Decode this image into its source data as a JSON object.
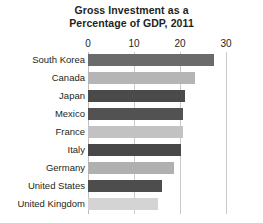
{
  "chart_data": {
    "type": "bar",
    "orientation": "horizontal",
    "title": "Gross Investment as a Percentage of GDP, 2011",
    "title_lines": [
      "Gross Investment as a",
      "Percentage of GDP, 2011"
    ],
    "xlabel": "",
    "ylabel": "",
    "xlim": [
      0,
      30
    ],
    "xticks": [
      0,
      10,
      20,
      30
    ],
    "xtick_labels": [
      "0",
      "10",
      "20",
      "30"
    ],
    "grid": true,
    "grid_axis": "x",
    "legend": false,
    "categories": [
      "South Korea",
      "Canada",
      "Japan",
      "Mexico",
      "France",
      "Italy",
      "Germany",
      "United States",
      "United Kingdom"
    ],
    "values": [
      27.4,
      23.3,
      21.1,
      20.7,
      20.6,
      20.2,
      18.7,
      16.1,
      15.2
    ],
    "bar_colors": [
      "#6b6b6b",
      "#b5b5b5",
      "#4a4a4a",
      "#525252",
      "#c2c2c2",
      "#484848",
      "#b0b0b0",
      "#4d4d4d",
      "#d4d4d4"
    ]
  },
  "colors": {
    "background": "#ffffff",
    "text": "#231f20",
    "gridline": "#c9c9c9"
  }
}
